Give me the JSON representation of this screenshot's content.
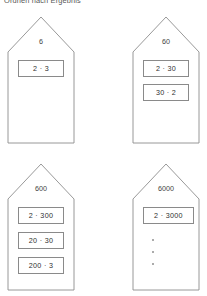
{
  "worksheet": {
    "title": "Ordnen nach Ergebnis",
    "line_color": "#8d8d8d",
    "text_color": "#3f3f3f"
  },
  "houses": [
    {
      "id": "house-6",
      "result": "6",
      "terms": [
        "2 · 3"
      ],
      "empty_slots": 0
    },
    {
      "id": "house-60",
      "result": "60",
      "terms": [
        "2 · 30",
        "30 · 2"
      ],
      "empty_slots": 0
    },
    {
      "id": "house-600",
      "result": "600",
      "terms": [
        "2 · 300",
        "20 · 30",
        "200 · 3"
      ],
      "empty_slots": 0
    },
    {
      "id": "house-6000",
      "result": "6000",
      "terms": [
        "2 · 3000"
      ],
      "empty_slots": 3
    }
  ]
}
